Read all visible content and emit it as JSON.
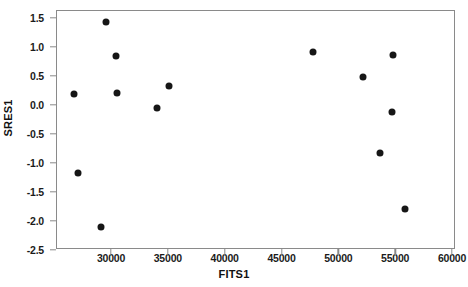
{
  "chart_data": {
    "type": "scatter",
    "title": "",
    "xlabel": "FITS1",
    "ylabel": "SRES1",
    "xlim": [
      26000,
      60500
    ],
    "ylim": [
      -2.6,
      1.65
    ],
    "grid": false,
    "legend": null,
    "xticks": [
      30000,
      35000,
      40000,
      45000,
      50000,
      55000,
      60000
    ],
    "xtick_labels": [
      "30000",
      "35000",
      "40000",
      "45000",
      "50000",
      "55000",
      "60000"
    ],
    "yticks": [
      1.5,
      1.0,
      0.5,
      0.0,
      -0.5,
      -1.0,
      -1.5,
      -2.0,
      -2.5
    ],
    "ytick_labels": [
      "1.5",
      "1.0",
      "0.5",
      "0.0",
      "-0.5",
      "-1.0",
      "-1.5",
      "-2.0",
      "-2.5"
    ],
    "marker": "filled-circle",
    "marker_color": "#161616",
    "points": [
      {
        "x": 26740,
        "y": 0.19
      },
      {
        "x": 27100,
        "y": -1.17
      },
      {
        "x": 29130,
        "y": -2.1
      },
      {
        "x": 29530,
        "y": 1.43
      },
      {
        "x": 30460,
        "y": 0.84
      },
      {
        "x": 30550,
        "y": 0.21
      },
      {
        "x": 34080,
        "y": -0.06
      },
      {
        "x": 35140,
        "y": 0.32
      },
      {
        "x": 47800,
        "y": 0.91
      },
      {
        "x": 52200,
        "y": 0.49
      },
      {
        "x": 53700,
        "y": -0.82
      },
      {
        "x": 54750,
        "y": -0.12
      },
      {
        "x": 54840,
        "y": 0.86
      },
      {
        "x": 55900,
        "y": -1.8
      }
    ]
  },
  "axes": {
    "x_title": "FITS1",
    "y_title": "SRES1"
  },
  "colors": {
    "marker": "#161616",
    "frame": "#8a8a8a",
    "text": "#111111",
    "background": "#ffffff"
  }
}
